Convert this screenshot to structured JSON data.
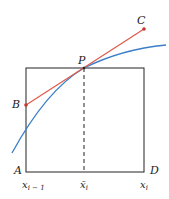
{
  "diagram": {
    "labels": {
      "A": "A",
      "B": "B",
      "C": "C",
      "D": "D",
      "P": "P"
    },
    "axis_labels": {
      "left": "x",
      "left_sub": "i − 1",
      "mid": "x̄",
      "mid_sub": "i",
      "right": "x",
      "right_sub": "i"
    },
    "colors": {
      "rectangle": "#222222",
      "tangent": "#e05a4a",
      "curve": "#3a7fc8",
      "point": "#c0392b"
    }
  }
}
